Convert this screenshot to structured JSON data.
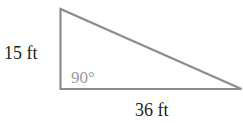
{
  "diagram": {
    "type": "right-triangle",
    "colors": {
      "stroke": "#8c8c8c",
      "label": "#222222",
      "angle_label": "#9a9a9a",
      "background": "#ffffff"
    },
    "vertical_side": {
      "label": "15 ft",
      "value": 15,
      "unit": "ft"
    },
    "horizontal_side": {
      "label": "36 ft",
      "value": 36,
      "unit": "ft"
    },
    "right_angle": {
      "label": "90°"
    }
  }
}
